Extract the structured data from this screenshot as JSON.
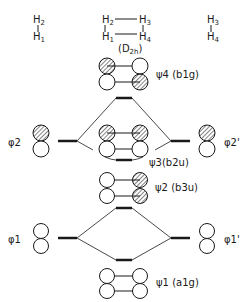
{
  "geometries": {
    "left": {
      "top": "H2",
      "bottom": "H1"
    },
    "center": {
      "tl": "H2",
      "tr": "H3",
      "bl": "H1",
      "br": "H4",
      "symmetry": "(D2h)"
    },
    "right": {
      "top": "H3",
      "bottom": "H4"
    }
  },
  "orbitals": {
    "psi4": {
      "name": "ψ4",
      "sym": "(b1g)"
    },
    "psi3": {
      "name": "ψ3",
      "sym": "(b2u)"
    },
    "psi2": {
      "name": "ψ2",
      "sym": "(b3u)"
    },
    "psi1": {
      "name": "ψ1",
      "sym": "(a1g)"
    },
    "phi2_left": "φ2",
    "phi2_right": "φ2'",
    "phi1_left": "φ1",
    "phi1_right": "φ1'"
  },
  "colors": {
    "ink": "#1a1a1a",
    "background": "#ffffff"
  }
}
